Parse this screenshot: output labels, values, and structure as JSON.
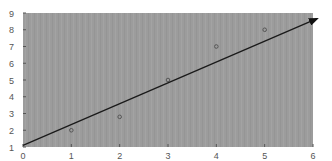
{
  "chart_data": {
    "type": "scatter",
    "title": "",
    "xlabel": "",
    "ylabel": "",
    "xlim": [
      0,
      6
    ],
    "ylim": [
      1,
      9
    ],
    "x_ticks": [
      "0",
      "1",
      "2",
      "3",
      "4",
      "5",
      "6"
    ],
    "y_ticks": [
      "1",
      "2",
      "3",
      "4",
      "5",
      "6",
      "7",
      "8",
      "9"
    ],
    "grid": false,
    "legend": null,
    "series": [
      {
        "name": "points",
        "type": "scatter",
        "x": [
          1,
          2,
          3,
          4,
          5
        ],
        "y": [
          2,
          2.8,
          5,
          7,
          8
        ]
      },
      {
        "name": "fit line",
        "type": "line",
        "x": [
          0,
          6
        ],
        "y": [
          1.1,
          8.6
        ],
        "arrow_end": true
      }
    ],
    "colors": {
      "plot_background": "#9a9a9a",
      "line": "#1a1a1a",
      "marker": "#555555",
      "tick_text": "#555555"
    }
  }
}
